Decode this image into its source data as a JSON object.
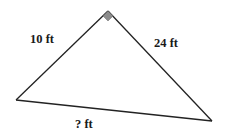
{
  "diagram": {
    "type": "right-triangle",
    "vertices": {
      "top": [
        108,
        11
      ],
      "left": [
        16,
        100
      ],
      "right": [
        212,
        121
      ]
    },
    "right_angle_vertex": "top",
    "labels": {
      "left_leg": "10 ft",
      "right_leg": "24 ft",
      "hypotenuse": "? ft"
    },
    "colors": {
      "stroke": "#222222",
      "right_angle_marker": "#8c8c8c",
      "text": "#1a1a1a"
    }
  }
}
